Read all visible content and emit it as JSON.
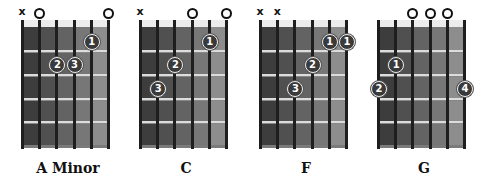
{
  "colors": {
    "fret_columns": [
      "#3d3d3d",
      "#505050",
      "#636363",
      "#777777",
      "#8d8d8d",
      "#a6a6a6"
    ],
    "string": "#1e1e1e",
    "finger_fill": "#3a3a3a"
  },
  "chords": [
    {
      "name": "A Minor",
      "string_marks": [
        {
          "string": 1,
          "symbol": "x"
        },
        {
          "string": 2,
          "symbol": "o"
        },
        {
          "string": 6,
          "symbol": "o"
        }
      ],
      "fingers": [
        {
          "label": "1",
          "string": 5,
          "fret": 1
        },
        {
          "label": "2",
          "string": 3,
          "fret": 2
        },
        {
          "label": "3",
          "string": 4,
          "fret": 2
        }
      ]
    },
    {
      "name": "C",
      "string_marks": [
        {
          "string": 1,
          "symbol": "x"
        },
        {
          "string": 4,
          "symbol": "o"
        },
        {
          "string": 6,
          "symbol": "o"
        }
      ],
      "fingers": [
        {
          "label": "1",
          "string": 5,
          "fret": 1
        },
        {
          "label": "2",
          "string": 3,
          "fret": 2
        },
        {
          "label": "3",
          "string": 2,
          "fret": 3
        }
      ]
    },
    {
      "name": "F",
      "string_marks": [
        {
          "string": 1,
          "symbol": "x"
        },
        {
          "string": 2,
          "symbol": "x"
        }
      ],
      "fingers": [
        {
          "label": "1",
          "string": 5,
          "fret": 1
        },
        {
          "label": "1",
          "string": 6,
          "fret": 1
        },
        {
          "label": "2",
          "string": 4,
          "fret": 2
        },
        {
          "label": "3",
          "string": 3,
          "fret": 3
        }
      ]
    },
    {
      "name": "G",
      "string_marks": [
        {
          "string": 3,
          "symbol": "o"
        },
        {
          "string": 4,
          "symbol": "o"
        },
        {
          "string": 5,
          "symbol": "o"
        }
      ],
      "fingers": [
        {
          "label": "1",
          "string": 2,
          "fret": 2
        },
        {
          "label": "2",
          "string": 1,
          "fret": 3
        },
        {
          "label": "4",
          "string": 6,
          "fret": 3
        }
      ]
    }
  ]
}
